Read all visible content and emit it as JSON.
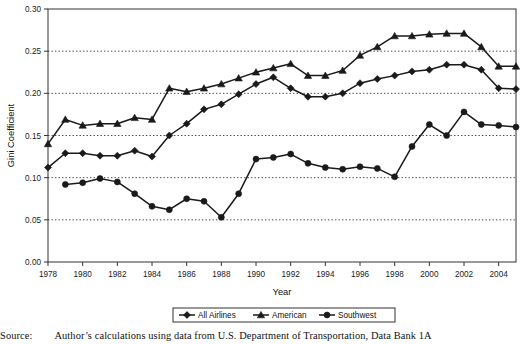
{
  "chart_data": {
    "type": "line",
    "title": "",
    "xlabel": "Year",
    "ylabel": "Gini Coefficient",
    "xlim": [
      1978,
      2005
    ],
    "ylim": [
      0.0,
      0.3
    ],
    "ytick_values": [
      0.0,
      0.05,
      0.1,
      0.15,
      0.2,
      0.25,
      0.3
    ],
    "ytick_labels": [
      "0.00",
      "0.05",
      "0.10",
      "0.15",
      "0.20",
      "0.25",
      "0.30"
    ],
    "xtick_values": [
      1978,
      1980,
      1982,
      1984,
      1986,
      1988,
      1990,
      1992,
      1994,
      1996,
      1998,
      2000,
      2002,
      2004
    ],
    "xtick_labels": [
      "1978",
      "1980",
      "1982",
      "1984",
      "1986",
      "1988",
      "1990",
      "1992",
      "1994",
      "1996",
      "1998",
      "2000",
      "2002",
      "2004"
    ],
    "x": [
      1978,
      1979,
      1980,
      1981,
      1982,
      1983,
      1984,
      1985,
      1986,
      1987,
      1988,
      1989,
      1990,
      1991,
      1992,
      1993,
      1994,
      1995,
      1996,
      1997,
      1998,
      1999,
      2000,
      2001,
      2002,
      2003,
      2004,
      2005
    ],
    "grid": "horizontal-dotted",
    "legend_position": "bottom-center",
    "series": [
      {
        "name": "All Airlines",
        "marker": "diamond",
        "color": "#1a1a1a",
        "x": [
          1978,
          1979,
          1980,
          1981,
          1982,
          1983,
          1984,
          1985,
          1986,
          1987,
          1988,
          1989,
          1990,
          1991,
          1992,
          1993,
          1994,
          1995,
          1996,
          1997,
          1998,
          1999,
          2000,
          2001,
          2002,
          2003,
          2004,
          2005
        ],
        "values": [
          0.112,
          0.129,
          0.129,
          0.126,
          0.126,
          0.132,
          0.125,
          0.15,
          0.164,
          0.181,
          0.187,
          0.199,
          0.211,
          0.219,
          0.206,
          0.196,
          0.196,
          0.2,
          0.212,
          0.217,
          0.221,
          0.226,
          0.228,
          0.234,
          0.234,
          0.228,
          0.206,
          0.205
        ]
      },
      {
        "name": "American",
        "marker": "triangle",
        "color": "#1a1a1a",
        "x": [
          1978,
          1979,
          1980,
          1981,
          1982,
          1983,
          1984,
          1985,
          1986,
          1987,
          1988,
          1989,
          1990,
          1991,
          1992,
          1993,
          1994,
          1995,
          1996,
          1997,
          1998,
          1999,
          2000,
          2001,
          2002,
          2003,
          2004,
          2005
        ],
        "values": [
          0.14,
          0.169,
          0.162,
          0.164,
          0.164,
          0.171,
          0.169,
          0.206,
          0.202,
          0.206,
          0.211,
          0.218,
          0.225,
          0.23,
          0.235,
          0.221,
          0.221,
          0.227,
          0.245,
          0.255,
          0.268,
          0.268,
          0.27,
          0.271,
          0.271,
          0.255,
          0.232,
          0.232
        ]
      },
      {
        "name": "Southwest",
        "marker": "circle",
        "color": "#1a1a1a",
        "x": [
          1979,
          1980,
          1981,
          1982,
          1983,
          1984,
          1985,
          1986,
          1987,
          1988,
          1989,
          1990,
          1991,
          1992,
          1993,
          1994,
          1995,
          1996,
          1997,
          1998,
          1999,
          2000,
          2001,
          2002,
          2003,
          2004,
          2005
        ],
        "values": [
          0.092,
          0.094,
          0.099,
          0.095,
          0.081,
          0.066,
          0.062,
          0.075,
          0.072,
          0.053,
          0.081,
          0.122,
          0.124,
          0.128,
          0.117,
          0.112,
          0.11,
          0.113,
          0.111,
          0.101,
          0.137,
          0.163,
          0.15,
          0.178,
          0.163,
          0.162,
          0.16
        ]
      }
    ]
  },
  "legend": {
    "items": [
      {
        "label": "All Airlines",
        "marker": "diamond"
      },
      {
        "label": "American",
        "marker": "triangle"
      },
      {
        "label": "Southwest",
        "marker": "circle"
      }
    ]
  },
  "caption": {
    "lead": "Source:",
    "text": "Author’s calculations using data from U.S. Department of Transportation, Data Bank 1A"
  }
}
